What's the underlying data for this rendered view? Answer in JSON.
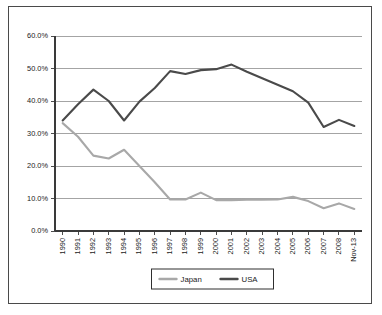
{
  "chart_data": {
    "type": "line",
    "title": "",
    "xlabel": "",
    "ylabel": "",
    "ylim": [
      0,
      60
    ],
    "ytick_labels": [
      "0.0%",
      "10.0%",
      "20.0%",
      "30.0%",
      "40.0%",
      "50.0%",
      "60.0%"
    ],
    "ytick_values": [
      0,
      10,
      20,
      30,
      40,
      50,
      60
    ],
    "grid": true,
    "legend_position": "bottom-center",
    "categories": [
      "1990",
      "1991",
      "1992",
      "1993",
      "1994",
      "1995",
      "1996",
      "1997",
      "1998",
      "1999",
      "2000",
      "2001",
      "2002",
      "2003",
      "2004",
      "2005",
      "2006",
      "2007",
      "2008",
      "Nov-13"
    ],
    "series": [
      {
        "name": "Japan",
        "color": "#a8a8a8",
        "values": [
          33.2,
          29.0,
          23.2,
          22.3,
          25.0,
          20.0,
          15.0,
          9.7,
          9.7,
          11.8,
          9.5,
          9.5,
          9.6,
          9.6,
          9.7,
          10.5,
          9.2,
          7.0,
          8.5,
          6.8
        ]
      },
      {
        "name": "USA",
        "color": "#4a4a4a",
        "values": [
          34.0,
          39.0,
          43.5,
          40.0,
          34.0,
          39.8,
          44.0,
          49.2,
          48.3,
          49.5,
          49.8,
          51.2,
          49.0,
          47.0,
          45.0,
          43.0,
          39.5,
          32.0,
          34.2,
          32.3
        ]
      }
    ]
  },
  "legend": {
    "items": [
      {
        "label": "Japan",
        "color": "#a8a8a8"
      },
      {
        "label": "USA",
        "color": "#4a4a4a"
      }
    ]
  }
}
